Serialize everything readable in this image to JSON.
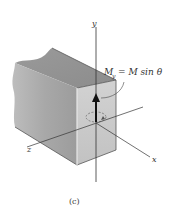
{
  "figure": {
    "caption": "(c)",
    "axes": {
      "x_label": "x",
      "y_label": "y",
      "z_label": "z"
    },
    "moment_label": {
      "lhs": "M",
      "lhs_sub": "y",
      "rhs": "= M sin θ"
    },
    "colors": {
      "front_face": "#c9c9c9",
      "side_face": "#a9a9a9",
      "top_face": "#9a9a9a",
      "axis_line": "#333333",
      "arrow": "#111111"
    }
  }
}
